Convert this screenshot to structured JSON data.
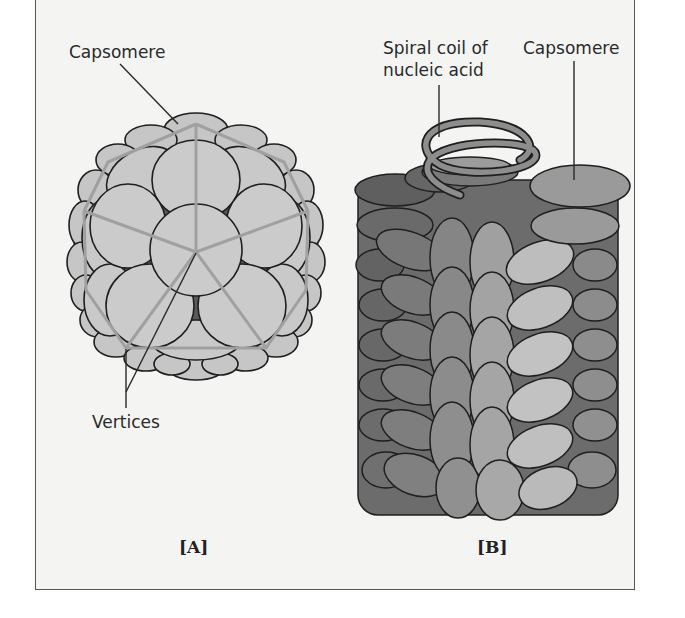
{
  "figure": {
    "panel_a": {
      "tag": "[A]",
      "title": "Icosahedral capsid",
      "labels": {
        "capsomere": "Capsomere",
        "vertices": "Vertices"
      }
    },
    "panel_b": {
      "tag": "[B]",
      "title": "Helical capsid",
      "labels": {
        "spiral_line1": "Spiral coil of",
        "spiral_line2": "nucleic acid",
        "capsomere": "Capsomere"
      }
    }
  },
  "colors": {
    "background": "#f4f4f3",
    "capsomere_light": "#c9c9c9",
    "capsomere_mid": "#9a9a9a",
    "capsomere_dark": "#6e6e6e",
    "outline": "#1f1f1f"
  }
}
